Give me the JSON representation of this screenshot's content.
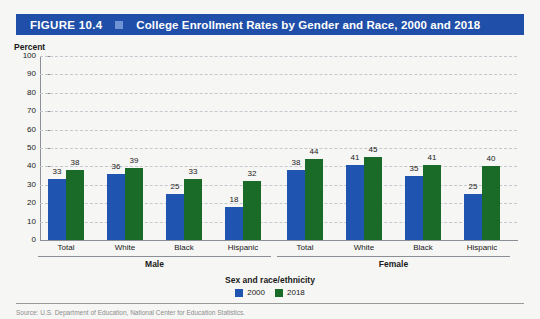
{
  "figure": {
    "number": "FIGURE 10.4",
    "title": "College Enrollment Rates by Gender and Race, 2000 and 2018",
    "header_bg": "#1f4fa8",
    "separator_icon": "square-marker"
  },
  "axis": {
    "y_label": "Percent",
    "y_ticks": [
      "100",
      "90",
      "80",
      "70",
      "60",
      "50",
      "40",
      "30",
      "20",
      "10",
      "0"
    ],
    "x_title": "Sex and race/ethnicity"
  },
  "legend": {
    "items": [
      {
        "label": "2000",
        "color": "#1f55b0"
      },
      {
        "label": "2018",
        "color": "#1a6b28"
      }
    ]
  },
  "source": {
    "text": "Source: U.S. Department of Education, National Center for Education Statistics."
  },
  "chart_data": {
    "type": "bar",
    "title": "College Enrollment Rates by Gender and Race, 2000 and 2018",
    "xlabel": "Sex and race/ethnicity",
    "ylabel": "Percent",
    "ylim": [
      0,
      100
    ],
    "ytick_step": 10,
    "grid": true,
    "legend_position": "bottom-center",
    "groups": [
      "Male",
      "Female"
    ],
    "categories": [
      "Total",
      "White",
      "Black",
      "Hispanic"
    ],
    "series": [
      {
        "name": "2000",
        "color": "#1f55b0",
        "values": {
          "Male": [
            33,
            36,
            25,
            18
          ],
          "Female": [
            38,
            41,
            35,
            25
          ]
        }
      },
      {
        "name": "2018",
        "color": "#1a6b28",
        "values": {
          "Male": [
            38,
            39,
            33,
            32
          ],
          "Female": [
            44,
            45,
            41,
            40
          ]
        }
      }
    ],
    "bars": [
      {
        "group": "Male",
        "category": "Total",
        "series": "2000",
        "value": 33
      },
      {
        "group": "Male",
        "category": "Total",
        "series": "2018",
        "value": 38
      },
      {
        "group": "Male",
        "category": "White",
        "series": "2000",
        "value": 36
      },
      {
        "group": "Male",
        "category": "White",
        "series": "2018",
        "value": 39
      },
      {
        "group": "Male",
        "category": "Black",
        "series": "2000",
        "value": 25
      },
      {
        "group": "Male",
        "category": "Black",
        "series": "2018",
        "value": 33
      },
      {
        "group": "Male",
        "category": "Hispanic",
        "series": "2000",
        "value": 18
      },
      {
        "group": "Male",
        "category": "Hispanic",
        "series": "2018",
        "value": 32
      },
      {
        "group": "Female",
        "category": "Total",
        "series": "2000",
        "value": 38
      },
      {
        "group": "Female",
        "category": "Total",
        "series": "2018",
        "value": 44
      },
      {
        "group": "Female",
        "category": "White",
        "series": "2000",
        "value": 41
      },
      {
        "group": "Female",
        "category": "White",
        "series": "2018",
        "value": 45
      },
      {
        "group": "Female",
        "category": "Black",
        "series": "2000",
        "value": 35
      },
      {
        "group": "Female",
        "category": "Black",
        "series": "2018",
        "value": 41
      },
      {
        "group": "Female",
        "category": "Hispanic",
        "series": "2000",
        "value": 25
      },
      {
        "group": "Female",
        "category": "Hispanic",
        "series": "2018",
        "value": 40
      }
    ]
  }
}
